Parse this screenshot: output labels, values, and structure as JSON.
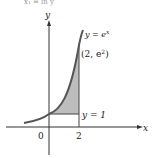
{
  "header_fragment": "x₁ = ln y",
  "axes": {
    "x_label": "x",
    "y_label": "y",
    "origin_label": "0",
    "x_tick_label": "2"
  },
  "curve": {
    "label": "y = e",
    "label_exp": "x",
    "color": "#444444"
  },
  "point": {
    "label_open": "(2, e",
    "label_exp": "2",
    "label_close": ")"
  },
  "line": {
    "label": "y = 1"
  },
  "region": {
    "fill": "#b8b8b8"
  }
}
